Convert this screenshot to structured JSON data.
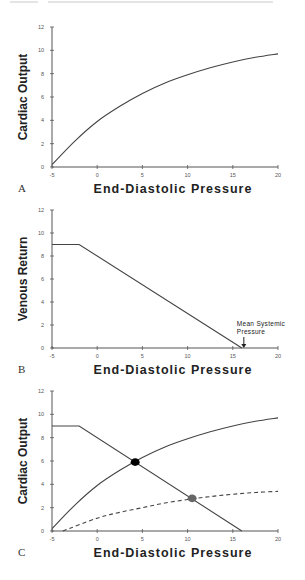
{
  "figure": {
    "panels": [
      {
        "label": "A",
        "ylabel": "Cardiac Output",
        "xlabel": "End-Diastolic Pressure"
      },
      {
        "label": "B",
        "ylabel": "Venous Return",
        "xlabel": "End-Diastolic Pressure",
        "annotation": [
          "Mean Systemic",
          "Pressure"
        ]
      },
      {
        "label": "C",
        "ylabel": "Cardiac Output",
        "xlabel": "End-Diastolic Pressure"
      }
    ]
  },
  "chart_data": [
    {
      "type": "line",
      "panel": "A",
      "title": "",
      "xlabel": "End-Diastolic Pressure",
      "ylabel": "Cardiac Output",
      "xlim": [
        -5,
        20
      ],
      "ylim": [
        0,
        12
      ],
      "xticks": [
        -5,
        0,
        5,
        10,
        15,
        20
      ],
      "yticks": [
        0,
        2,
        4,
        6,
        8,
        10,
        12
      ],
      "grid": false,
      "series": [
        {
          "name": "Cardiac function curve",
          "style": "solid",
          "x": [
            -5,
            -2.5,
            0,
            2.5,
            5,
            7.5,
            10,
            12.5,
            15,
            17.5,
            20
          ],
          "y": [
            0.2,
            2.2,
            3.9,
            5.2,
            6.3,
            7.2,
            7.9,
            8.5,
            9.0,
            9.4,
            9.7
          ]
        }
      ]
    },
    {
      "type": "line",
      "panel": "B",
      "title": "",
      "xlabel": "End-Diastolic Pressure",
      "ylabel": "Venous Return",
      "xlim": [
        -5,
        20
      ],
      "ylim": [
        0,
        12
      ],
      "xticks": [
        -5,
        0,
        5,
        10,
        15,
        20
      ],
      "yticks": [
        0,
        2,
        4,
        6,
        8,
        10,
        12
      ],
      "grid": false,
      "series": [
        {
          "name": "Venous return curve",
          "style": "solid",
          "x": [
            -5,
            -2,
            16
          ],
          "y": [
            9,
            9,
            0
          ]
        }
      ],
      "annotations": [
        {
          "text": "Mean Systemic Pressure",
          "x": 16,
          "y": 0,
          "arrow": true
        }
      ]
    },
    {
      "type": "line",
      "panel": "C",
      "title": "",
      "xlabel": "End-Diastolic Pressure",
      "ylabel": "Cardiac Output",
      "xlim": [
        -5,
        20
      ],
      "ylim": [
        0,
        12
      ],
      "xticks": [
        -5,
        0,
        5,
        10,
        15,
        20
      ],
      "yticks": [
        0,
        2,
        4,
        6,
        8,
        10,
        12
      ],
      "grid": false,
      "series": [
        {
          "name": "Normal cardiac function",
          "style": "solid",
          "x": [
            -5,
            -2.5,
            0,
            2.5,
            5,
            7.5,
            10,
            12.5,
            15,
            17.5,
            20
          ],
          "y": [
            0.2,
            2.2,
            3.9,
            5.2,
            6.3,
            7.2,
            7.9,
            8.5,
            9.0,
            9.4,
            9.7
          ]
        },
        {
          "name": "Venous return",
          "style": "solid",
          "x": [
            -5,
            -2,
            16
          ],
          "y": [
            9,
            9,
            0
          ]
        },
        {
          "name": "Depressed cardiac function",
          "style": "dashed",
          "x": [
            -3.8,
            0,
            2.5,
            5,
            7.5,
            10,
            12.5,
            15,
            17.5,
            20
          ],
          "y": [
            0,
            1.1,
            1.6,
            2.0,
            2.4,
            2.7,
            2.95,
            3.15,
            3.3,
            3.4
          ]
        }
      ],
      "points": [
        {
          "name": "Normal equilibrium",
          "x": 4.2,
          "y": 5.9,
          "color": "#000000"
        },
        {
          "name": "Depressed equilibrium",
          "x": 10.5,
          "y": 2.8,
          "color": "#666666"
        }
      ]
    }
  ]
}
